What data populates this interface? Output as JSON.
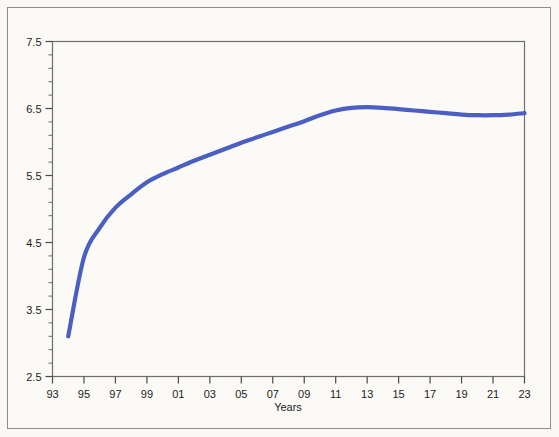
{
  "chart_data": {
    "type": "line",
    "title": "",
    "subtitle": "",
    "xlabel": "Years",
    "ylabel": "",
    "xlim": [
      93,
      123
    ],
    "ylim": [
      2.5,
      7.5
    ],
    "grid": false,
    "legend": null,
    "line_color": "#4a5fc1",
    "x_tick_labels": [
      "93",
      "95",
      "97",
      "99",
      "01",
      "03",
      "05",
      "07",
      "09",
      "11",
      "13",
      "15",
      "17",
      "19",
      "21",
      "23"
    ],
    "x_tick_values": [
      93,
      95,
      97,
      99,
      101,
      103,
      105,
      107,
      109,
      111,
      113,
      115,
      117,
      119,
      121,
      123
    ],
    "y_tick_labels": [
      "2.5",
      "3.5",
      "4.5",
      "5.5",
      "6.5",
      "7.5"
    ],
    "y_tick_values": [
      2.5,
      3.5,
      4.5,
      5.5,
      6.5,
      7.5
    ],
    "y_minor_step": 0.2,
    "series": [
      {
        "name": "series-1",
        "x": [
          94,
          95,
          96,
          97,
          98,
          99,
          100,
          101,
          102,
          103,
          104,
          105,
          106,
          107,
          108,
          109,
          110,
          111,
          112,
          113,
          114,
          115,
          116,
          117,
          118,
          119,
          120,
          121,
          122,
          123
        ],
        "values": [
          3.1,
          4.28,
          4.72,
          5.02,
          5.22,
          5.4,
          5.52,
          5.62,
          5.72,
          5.81,
          5.9,
          5.99,
          6.07,
          6.15,
          6.23,
          6.31,
          6.4,
          6.47,
          6.51,
          6.52,
          6.51,
          6.49,
          6.47,
          6.45,
          6.43,
          6.41,
          6.4,
          6.4,
          6.41,
          6.43
        ]
      }
    ]
  },
  "figure": {
    "background_color": "#fbfaf7",
    "frame_color": "#8d8d8d",
    "axis_color": "#5a5a5a"
  }
}
